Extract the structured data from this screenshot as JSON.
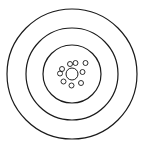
{
  "diagram": {
    "width": 148,
    "height": 151,
    "background": "#ffffff",
    "stroke": "#1a1a1a",
    "center": {
      "cx": 72,
      "cy": 74
    },
    "rings": [
      {
        "name": "outer-ring",
        "r": 65,
        "stroke_width": 1.2
      },
      {
        "name": "middle-ring",
        "r": 46,
        "stroke_width": 1.2
      },
      {
        "name": "inner-ring",
        "r": 29,
        "stroke_width": 1.2
      }
    ],
    "nucleus": {
      "cx": 72,
      "cy": 74,
      "r": 6,
      "stroke_width": 1
    },
    "particles": [
      {
        "cx": 70,
        "cy": 64,
        "r": 2.5
      },
      {
        "cx": 75.5,
        "cy": 63,
        "r": 2.5
      },
      {
        "cx": 85.5,
        "cy": 63,
        "r": 2.5
      },
      {
        "cx": 62,
        "cy": 69,
        "r": 2.5
      },
      {
        "cx": 60,
        "cy": 73.5,
        "r": 2.5
      },
      {
        "cx": 82.5,
        "cy": 72,
        "r": 2.5
      },
      {
        "cx": 63.5,
        "cy": 81.5,
        "r": 2.5
      },
      {
        "cx": 71.5,
        "cy": 85.5,
        "r": 2.5
      },
      {
        "cx": 81,
        "cy": 83,
        "r": 2.5
      }
    ]
  }
}
